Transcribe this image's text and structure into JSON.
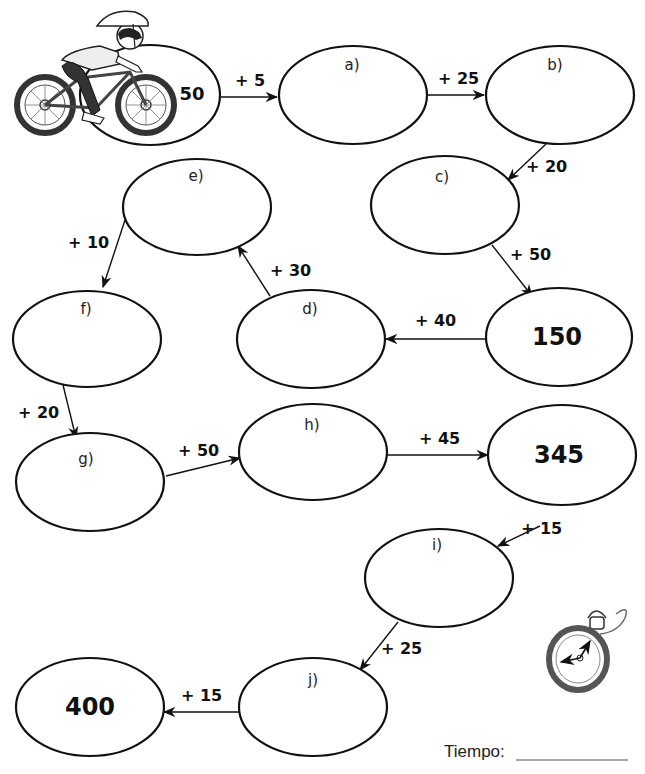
{
  "worksheet": {
    "start_value": "50",
    "nodes": [
      {
        "id": "start",
        "label": "",
        "value": "50"
      },
      {
        "id": "a",
        "label": "a)",
        "value": ""
      },
      {
        "id": "b",
        "label": "b)",
        "value": ""
      },
      {
        "id": "c",
        "label": "c)",
        "value": ""
      },
      {
        "id": "k150",
        "label": "",
        "value": "150"
      },
      {
        "id": "d",
        "label": "d)",
        "value": ""
      },
      {
        "id": "e",
        "label": "e)",
        "value": ""
      },
      {
        "id": "f",
        "label": "f)",
        "value": ""
      },
      {
        "id": "g",
        "label": "g)",
        "value": ""
      },
      {
        "id": "h",
        "label": "h)",
        "value": ""
      },
      {
        "id": "k345",
        "label": "",
        "value": "345"
      },
      {
        "id": "i",
        "label": "i)",
        "value": ""
      },
      {
        "id": "j",
        "label": "j)",
        "value": ""
      },
      {
        "id": "k400",
        "label": "",
        "value": "400"
      }
    ],
    "edges": [
      {
        "from": "start",
        "to": "a",
        "op": "+ 5"
      },
      {
        "from": "a",
        "to": "b",
        "op": "+ 25"
      },
      {
        "from": "b",
        "to": "c",
        "op": "+ 20"
      },
      {
        "from": "c",
        "to": "k150",
        "op": "+ 50"
      },
      {
        "from": "k150",
        "to": "d",
        "op": "+ 40"
      },
      {
        "from": "d",
        "to": "e",
        "op": "+ 30"
      },
      {
        "from": "e",
        "to": "f",
        "op": "+ 10"
      },
      {
        "from": "f",
        "to": "g",
        "op": "+ 20"
      },
      {
        "from": "g",
        "to": "h",
        "op": "+ 50"
      },
      {
        "from": "h",
        "to": "k345",
        "op": "+ 45"
      },
      {
        "from": "k345",
        "to": "i",
        "op": "+ 15"
      },
      {
        "from": "i",
        "to": "j",
        "op": "+ 25"
      },
      {
        "from": "j",
        "to": "k400",
        "op": "+ 15"
      }
    ],
    "footer": {
      "time_label": "Tiempo:"
    },
    "illustrations": [
      "cyclist-icon",
      "stopwatch-icon"
    ]
  }
}
